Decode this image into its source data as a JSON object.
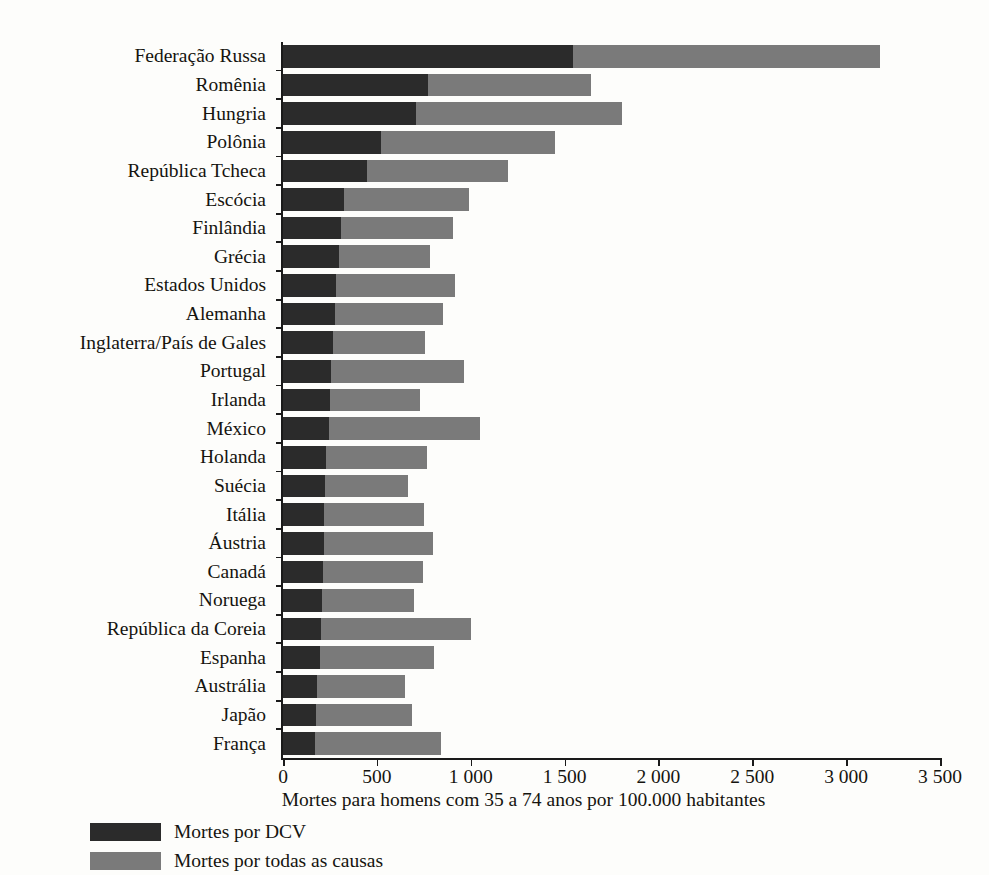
{
  "chart_data": {
    "type": "bar",
    "orientation": "horizontal",
    "stacked": true,
    "title": "",
    "xlabel": "Mortes para homens com 35 a 74 anos por 100.000 habitantes",
    "ylabel": "",
    "xlim": [
      0,
      3500
    ],
    "xticks": [
      0,
      500,
      1000,
      1500,
      2000,
      2500,
      3000,
      3500
    ],
    "xtick_labels": [
      "0",
      "500",
      "1 000",
      "1 500",
      "2 000",
      "2 500",
      "3 000",
      "3 500"
    ],
    "grid": false,
    "legend_position": "bottom-left",
    "colors": {
      "dcv": "#2b2b2b",
      "all_causes": "#7a7a7a"
    },
    "categories": [
      "Federação Russa",
      "Romênia",
      "Hungria",
      "Polônia",
      "República Tcheca",
      "Escócia",
      "Finlândia",
      "Grécia",
      "Estados Unidos",
      "Alemanha",
      "Inglaterra/País de Gales",
      "Portugal",
      "Irlanda",
      "México",
      "Holanda",
      "Suécia",
      "Itália",
      "Áustria",
      "Canadá",
      "Noruega",
      "República da Coreia",
      "Espanha",
      "Austrália",
      "Japão",
      "França"
    ],
    "series": [
      {
        "name": "Mortes por DCV",
        "color": "#2b2b2b",
        "values": [
          1545,
          770,
          710,
          520,
          450,
          325,
          310,
          300,
          285,
          275,
          265,
          255,
          250,
          245,
          230,
          225,
          220,
          220,
          215,
          210,
          205,
          195,
          180,
          175,
          170
        ]
      },
      {
        "name": "Mortes por todas as causas",
        "color": "#7a7a7a",
        "values": [
          3180,
          1640,
          1805,
          1450,
          1200,
          990,
          905,
          785,
          915,
          855,
          755,
          965,
          730,
          1050,
          765,
          665,
          750,
          800,
          745,
          700,
          1000,
          805,
          650,
          685,
          840
        ]
      }
    ]
  },
  "legend": {
    "items": [
      {
        "label": "Mortes por DCV",
        "color": "#2b2b2b"
      },
      {
        "label": "Mortes por todas as causas",
        "color": "#7a7a7a"
      }
    ]
  }
}
